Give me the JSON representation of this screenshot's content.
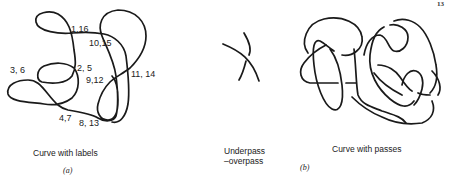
{
  "page": {
    "page_number_fragment": "13"
  },
  "panel_a": {
    "crossing_labels": [
      "1,16",
      "10,15",
      "3, 6",
      "2, 5",
      "9,12",
      "11, 14",
      "4,7",
      "8, 13"
    ],
    "caption": "Curve with labels",
    "sublabel": "(a)"
  },
  "middle": {
    "caption_line1": "Underpass",
    "caption_line2": "–overpass"
  },
  "panel_b": {
    "caption": "Curve with passes",
    "sublabel": "(b)"
  }
}
